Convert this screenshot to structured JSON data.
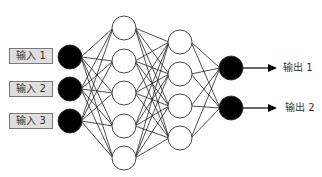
{
  "diagram": {
    "type": "neural-network",
    "inputs": [
      {
        "label": "输入 1"
      },
      {
        "label": "输入 2"
      },
      {
        "label": "输入 3"
      }
    ],
    "hidden_layers": [
      {
        "nodes": 5
      },
      {
        "nodes": 4
      }
    ],
    "outputs": [
      {
        "label": "输出 1"
      },
      {
        "label": "输出 2"
      }
    ],
    "colors": {
      "input_node": "#000000",
      "hidden_node": "#ffffff",
      "output_node": "#000000",
      "edge": "#222222",
      "label_box": "#dedede"
    }
  }
}
